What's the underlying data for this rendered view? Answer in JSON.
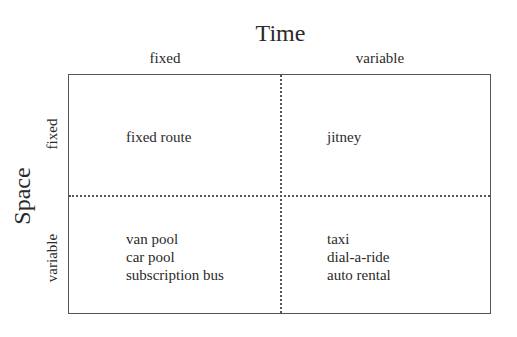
{
  "diagram": {
    "x_axis_title": "Time",
    "y_axis_title": "Space",
    "columns": [
      {
        "label": "fixed"
      },
      {
        "label": "variable"
      }
    ],
    "rows": [
      {
        "label": "fixed"
      },
      {
        "label": "variable"
      }
    ],
    "cells": {
      "fixed_fixed": {
        "items": [
          "fixed route"
        ]
      },
      "fixed_variable": {
        "items": [
          "jitney"
        ]
      },
      "variable_fixed": {
        "items": [
          "van pool",
          "car pool",
          "subscription bus"
        ]
      },
      "variable_variable": {
        "items": [
          "taxi",
          "dial-a-ride",
          "auto rental"
        ]
      }
    },
    "colors": {
      "text": "#2a2a2a",
      "lines": "#555555",
      "background": "#ffffff"
    }
  }
}
